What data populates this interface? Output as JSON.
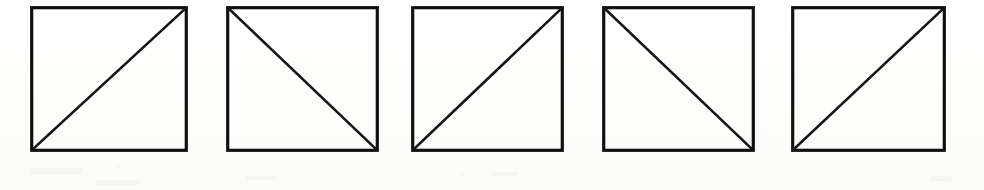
{
  "figure": {
    "background_color": "#fdfdfc",
    "stroke_color": "#111111",
    "diagonal_color": "#141414",
    "canvas": {
      "width": 984,
      "height": 190
    },
    "shape_count": "5"
  },
  "shapes": [
    {
      "index": "1",
      "name": "square-with-diagonal",
      "diagonal_direction": "bottom-left-to-top-right",
      "x": 30,
      "y": 6,
      "width": 158,
      "height": 146
    },
    {
      "index": "2",
      "name": "square-with-diagonal",
      "diagonal_direction": "top-left-to-bottom-right",
      "x": 226,
      "y": 6,
      "width": 153,
      "height": 146
    },
    {
      "index": "3",
      "name": "square-with-diagonal",
      "diagonal_direction": "bottom-left-to-top-right",
      "x": 411,
      "y": 6,
      "width": 153,
      "height": 146
    },
    {
      "index": "4",
      "name": "square-with-diagonal",
      "diagonal_direction": "top-left-to-bottom-right",
      "x": 602,
      "y": 6,
      "width": 153,
      "height": 146
    },
    {
      "index": "5",
      "name": "square-with-diagonal",
      "diagonal_direction": "bottom-left-to-top-right",
      "x": 791,
      "y": 6,
      "width": 155,
      "height": 146
    }
  ],
  "artifacts": [
    {
      "name": "scan-smudge",
      "x": 30,
      "y": 168,
      "width": 52,
      "height": 6
    },
    {
      "name": "scan-smudge",
      "x": 96,
      "y": 180,
      "width": 44,
      "height": 5
    },
    {
      "name": "scan-smudge",
      "x": 246,
      "y": 176,
      "width": 30,
      "height": 4
    },
    {
      "name": "scan-smudge",
      "x": 492,
      "y": 172,
      "width": 26,
      "height": 4
    },
    {
      "name": "scan-smudge",
      "x": 930,
      "y": 176,
      "width": 22,
      "height": 5
    }
  ]
}
